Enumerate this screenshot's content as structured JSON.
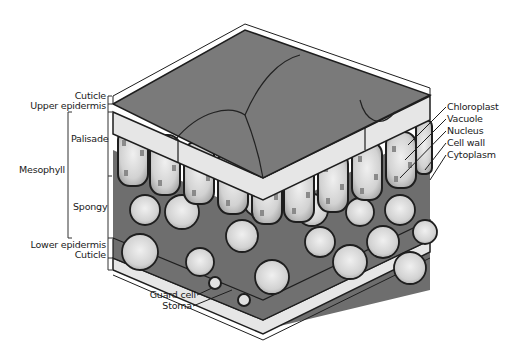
{
  "figure": {
    "type": "leaf cross-section illustration",
    "colors": {
      "surface": "#7a7a7a",
      "epidermis": "#e6e6e6",
      "cell_fill": "#cfcfcf",
      "vacuole": "#ededed",
      "chloroplast": "#8c8c8c",
      "outline": "#1e1e1e",
      "interior_shadow": "#6e6e6e"
    }
  },
  "labels_left": {
    "cuticle_top": "Cuticle",
    "upper_epidermis": "Upper epidermis",
    "palisade": "Palisade",
    "mesophyll": "Mesophyll",
    "spongy": "Spongy",
    "lower_epidermis": "Lower epidermis",
    "cuticle_bottom": "Cuticle"
  },
  "labels_right": {
    "chloroplast": "Chloroplast",
    "vacuole": "Vacuole",
    "nucleus": "Nucleus",
    "cell_wall": "Cell wall",
    "cytoplasm": "Cytoplasm"
  },
  "labels_bottom": {
    "guard_cell": "Guard cell",
    "stoma": "Stoma"
  }
}
